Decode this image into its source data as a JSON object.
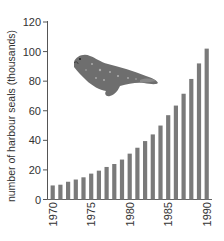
{
  "chart_data": {
    "type": "bar",
    "title": "",
    "xlabel": "",
    "ylabel": "number of harbour seals (thousands)",
    "ylim": [
      0,
      120
    ],
    "yticks": [
      0,
      20,
      40,
      60,
      80,
      100,
      120
    ],
    "xtick_labels": [
      "1970",
      "1975",
      "1980",
      "1985",
      "1990"
    ],
    "categories": [
      "1970",
      "1971",
      "1972",
      "1973",
      "1974",
      "1975",
      "1976",
      "1977",
      "1978",
      "1979",
      "1980",
      "1981",
      "1982",
      "1983",
      "1984",
      "1985",
      "1986",
      "1987",
      "1988",
      "1989",
      "1990"
    ],
    "values": [
      9.5,
      10,
      12,
      13.5,
      15,
      17.5,
      19.5,
      22,
      24,
      27,
      31,
      35,
      39.5,
      44,
      50,
      57,
      63.5,
      71.5,
      81.5,
      92,
      102
    ],
    "grid": false,
    "legend": null,
    "bar_color": "#7a7a7a",
    "annotations": [
      "harbour seal illustration (decorative)"
    ]
  }
}
